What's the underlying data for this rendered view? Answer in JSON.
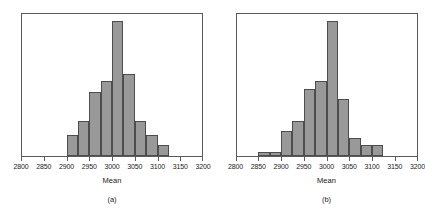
{
  "figure": {
    "background_color": "#ffffff",
    "bar_fill_color": "#999999",
    "bar_edge_color": "#4d4d4d",
    "frame_color": "#5a5a5a"
  },
  "chart_data": [
    {
      "type": "bar",
      "title": "",
      "subtitle": "",
      "caption": "(a)",
      "xlabel": "Mean",
      "ylabel": "",
      "xlim": [
        2800,
        3200
      ],
      "ylim": [
        0,
        20
      ],
      "grid": false,
      "legend": "none",
      "xticks": [
        2800,
        2850,
        2900,
        2950,
        3000,
        3050,
        3100,
        3150,
        3200
      ],
      "xticklabels": [
        "2800",
        "2850",
        "2900",
        "2950",
        "3000",
        "3050",
        "3100",
        "3150",
        "3200"
      ],
      "bin_width": 25,
      "bin_edges": [
        2900,
        2925,
        2950,
        2975,
        3000,
        3025,
        3050,
        3075,
        3100,
        3125
      ],
      "categories": [
        "2900-2925",
        "2925-2950",
        "2950-2975",
        "2975-3000",
        "3000-3025",
        "3025-3050",
        "3050-3075",
        "3075-3100",
        "3100-3125"
      ],
      "values": [
        3,
        5,
        9,
        10.5,
        19,
        11.5,
        5,
        3,
        1.5
      ]
    },
    {
      "type": "bar",
      "title": "",
      "subtitle": "",
      "caption": "(b)",
      "xlabel": "Mean",
      "ylabel": "",
      "xlim": [
        2800,
        3200
      ],
      "ylim": [
        0,
        20
      ],
      "grid": false,
      "legend": "none",
      "xticks": [
        2800,
        2850,
        2900,
        2950,
        3000,
        3050,
        3100,
        3150,
        3200
      ],
      "xticklabels": [
        "2800",
        "2850",
        "2900",
        "2950",
        "3000",
        "3050",
        "3100",
        "3150",
        "3200"
      ],
      "bin_width": 25,
      "bin_edges": [
        2850,
        2875,
        2900,
        2925,
        2950,
        2975,
        3000,
        3025,
        3050,
        3075,
        3100,
        3125
      ],
      "categories": [
        "2850-2875",
        "2875-2900",
        "2900-2925",
        "2925-2950",
        "2950-2975",
        "2975-3000",
        "3000-3025",
        "3025-3050",
        "3050-3075",
        "3075-3100",
        "3100-3125"
      ],
      "values": [
        0.5,
        0.5,
        3.5,
        5,
        9.5,
        10.5,
        19,
        8,
        2.5,
        1.5,
        1.5
      ]
    }
  ]
}
